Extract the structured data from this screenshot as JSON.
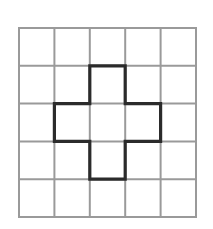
{
  "figure": {
    "background_color": "#ffffff",
    "canvas": {
      "width": 213,
      "height": 229
    }
  },
  "grid": {
    "name": "square-lattice",
    "rows": 5,
    "columns": 5,
    "origin_x": 19,
    "origin_y": 28,
    "cell_width": 35.4,
    "cell_height": 37.8,
    "line_color": "#9a9a9a",
    "line_width": 2.0,
    "border_color": "#9a9a9a",
    "border_width": 2.0,
    "x_lines": [
      19,
      54.4,
      89.8,
      125.2,
      160.6,
      196
    ],
    "y_lines": [
      28,
      65.8,
      103.6,
      141.4,
      179.2,
      217
    ]
  },
  "shape": {
    "name": "plus-polygon",
    "label": "plus",
    "stroke_color": "#2b2b2b",
    "stroke_width": 3.2,
    "fill": "none",
    "cell_count": 5,
    "occupied_cells": [
      {
        "row": 2,
        "col": 3
      },
      {
        "row": 3,
        "col": 2
      },
      {
        "row": 3,
        "col": 3
      },
      {
        "row": 3,
        "col": 4
      },
      {
        "row": 4,
        "col": 3
      }
    ],
    "outline_points": [
      [
        89.8,
        65.8
      ],
      [
        125.2,
        65.8
      ],
      [
        125.2,
        103.6
      ],
      [
        160.6,
        103.6
      ],
      [
        160.6,
        141.4
      ],
      [
        125.2,
        141.4
      ],
      [
        125.2,
        179.2
      ],
      [
        89.8,
        179.2
      ],
      [
        89.8,
        141.4
      ],
      [
        54.4,
        141.4
      ],
      [
        54.4,
        103.6
      ],
      [
        89.8,
        103.6
      ]
    ]
  },
  "chart_data": {
    "type": "heatmap",
    "xlabel": "",
    "ylabel": "",
    "categories": [
      "1",
      "2",
      "3",
      "4",
      "5"
    ],
    "rows": [
      "1",
      "2",
      "3",
      "4",
      "5"
    ],
    "values": [
      [
        0,
        0,
        0,
        0,
        0
      ],
      [
        0,
        0,
        1,
        0,
        0
      ],
      [
        0,
        1,
        1,
        1,
        0
      ],
      [
        0,
        0,
        1,
        0,
        0
      ],
      [
        0,
        0,
        0,
        0,
        0
      ]
    ],
    "legend": [],
    "grid": true
  }
}
